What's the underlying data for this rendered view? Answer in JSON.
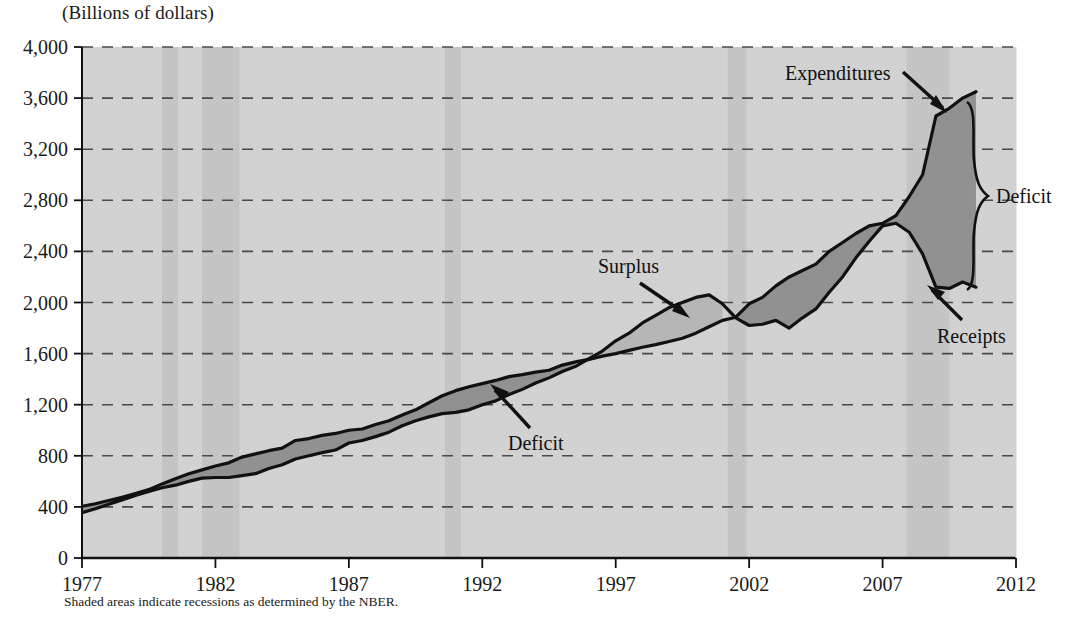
{
  "title": "(Billions of dollars)",
  "footnote": "Shaded areas indicate recessions as determined by the NBER.",
  "axes": {
    "y_ticks": [
      "0",
      "400",
      "800",
      "1,200",
      "1,600",
      "2,000",
      "2,400",
      "2,800",
      "3,200",
      "3,600",
      "4,000"
    ],
    "x_ticks": [
      "1977",
      "1982",
      "1987",
      "1992",
      "1997",
      "2002",
      "2007",
      "2012"
    ]
  },
  "annotations": {
    "expenditures": "Expenditures",
    "receipts": "Receipts",
    "surplus": "Surplus",
    "deficit_mid": "Deficit",
    "deficit_right": "Deficit"
  },
  "colors": {
    "plot_background": "#d2d2d2",
    "recession_band": "#c2c2c2",
    "deficit_fill": "#909090",
    "surplus_fill": "#b4b4b4",
    "line": "#111111",
    "gridline": "#4a4a4a"
  },
  "chart_data": {
    "type": "area",
    "title": "(Billions of dollars)",
    "subtitle": "",
    "xlabel": "",
    "ylabel": "Billions of dollars",
    "xlim": [
      1977,
      2012
    ],
    "ylim": [
      0,
      4000
    ],
    "ytick_step": 400,
    "xtick_step": 5,
    "grid": "horizontal-dashed",
    "legend": "none (direct annotations)",
    "fill_semantics": {
      "dark_fill": "Deficit (Expenditures above Receipts)",
      "light_fill": "Surplus (Receipts above Expenditures)"
    },
    "recessions": [
      {
        "start": 1980.0,
        "end": 1980.6
      },
      {
        "start": 1981.5,
        "end": 1982.9
      },
      {
        "start": 1990.6,
        "end": 1991.2
      },
      {
        "start": 2001.2,
        "end": 2001.9
      },
      {
        "start": 2007.9,
        "end": 2009.5
      }
    ],
    "series": [
      {
        "name": "Expenditures",
        "x": [
          1977.0,
          1977.5,
          1978.0,
          1978.5,
          1979.0,
          1979.5,
          1980.0,
          1980.5,
          1981.0,
          1981.5,
          1982.0,
          1982.5,
          1983.0,
          1983.5,
          1984.0,
          1984.5,
          1985.0,
          1985.5,
          1986.0,
          1986.5,
          1987.0,
          1987.5,
          1988.0,
          1988.5,
          1989.0,
          1989.5,
          1990.0,
          1990.5,
          1991.0,
          1991.5,
          1992.0,
          1992.5,
          1993.0,
          1993.5,
          1994.0,
          1994.5,
          1995.0,
          1995.5,
          1996.0,
          1996.5,
          1997.0,
          1997.5,
          1998.0,
          1998.5,
          1999.0,
          1999.5,
          2000.0,
          2000.5,
          2001.0,
          2001.5,
          2002.0,
          2002.5,
          2003.0,
          2003.5,
          2004.0,
          2004.5,
          2005.0,
          2005.5,
          2006.0,
          2006.5,
          2007.0,
          2007.5,
          2008.0,
          2008.5,
          2009.0,
          2009.5,
          2010.0,
          2010.5
        ],
        "values": [
          405,
          425,
          450,
          475,
          505,
          535,
          580,
          620,
          660,
          690,
          720,
          745,
          790,
          815,
          840,
          860,
          920,
          935,
          960,
          975,
          1000,
          1010,
          1045,
          1075,
          1120,
          1160,
          1215,
          1270,
          1310,
          1340,
          1365,
          1390,
          1420,
          1435,
          1455,
          1470,
          1510,
          1535,
          1555,
          1580,
          1600,
          1625,
          1650,
          1670,
          1695,
          1720,
          1760,
          1810,
          1860,
          1885,
          1990,
          2040,
          2130,
          2200,
          2250,
          2300,
          2400,
          2470,
          2540,
          2600,
          2620,
          2680,
          2830,
          3000,
          3460,
          3520,
          3600,
          3650
        ],
        "units": "billions of dollars"
      },
      {
        "name": "Receipts",
        "x": [
          1977.0,
          1977.5,
          1978.0,
          1978.5,
          1979.0,
          1979.5,
          1980.0,
          1980.5,
          1981.0,
          1981.5,
          1982.0,
          1982.5,
          1983.0,
          1983.5,
          1984.0,
          1984.5,
          1985.0,
          1985.5,
          1986.0,
          1986.5,
          1987.0,
          1987.5,
          1988.0,
          1988.5,
          1989.0,
          1989.5,
          1990.0,
          1990.5,
          1991.0,
          1991.5,
          1992.0,
          1992.5,
          1993.0,
          1993.5,
          1994.0,
          1994.5,
          1995.0,
          1995.5,
          1996.0,
          1996.5,
          1997.0,
          1997.5,
          1998.0,
          1998.5,
          1999.0,
          1999.5,
          2000.0,
          2000.5,
          2001.0,
          2001.5,
          2002.0,
          2002.5,
          2003.0,
          2003.5,
          2004.0,
          2004.5,
          2005.0,
          2005.5,
          2006.0,
          2006.5,
          2007.0,
          2007.5,
          2008.0,
          2008.5,
          2009.0,
          2009.5,
          2010.0,
          2010.5
        ],
        "values": [
          355,
          385,
          420,
          455,
          490,
          520,
          550,
          570,
          600,
          625,
          630,
          630,
          645,
          660,
          700,
          730,
          775,
          800,
          825,
          845,
          900,
          920,
          950,
          985,
          1035,
          1075,
          1105,
          1130,
          1140,
          1160,
          1200,
          1230,
          1280,
          1320,
          1370,
          1410,
          1460,
          1500,
          1560,
          1620,
          1700,
          1760,
          1840,
          1900,
          1960,
          2000,
          2040,
          2060,
          1990,
          1880,
          1820,
          1830,
          1860,
          1800,
          1880,
          1950,
          2080,
          2200,
          2350,
          2480,
          2600,
          2620,
          2550,
          2380,
          2120,
          2110,
          2160,
          2120
        ],
        "units": "billions of dollars"
      }
    ],
    "annotation_points": [
      {
        "label": "Expenditures",
        "x": 2008.3,
        "y": 3420,
        "note": "arrow points to expenditures line near 2008"
      },
      {
        "label": "Receipts",
        "x": 2009.6,
        "y": 2120,
        "note": "arrow points to receipts line near 2009"
      },
      {
        "label": "Surplus",
        "x": 1999.6,
        "y": 2000,
        "note": "arrow points to light-shaded surplus wedge 1998-2001"
      },
      {
        "label": "Deficit",
        "x": 1994.5,
        "y": 1450,
        "note": "arrow points to dark-shaded deficit band mid-1990s"
      },
      {
        "label": "Deficit",
        "x": 2011.3,
        "y": 2870,
        "note": "brace spanning receipts to expenditures at right edge"
      }
    ]
  }
}
